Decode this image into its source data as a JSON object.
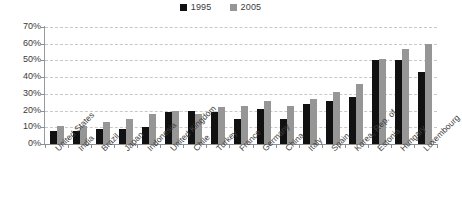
{
  "legend": {
    "position": "top-center",
    "items": [
      {
        "label": "1995",
        "color": "#111111",
        "icon": "square-marker-icon"
      },
      {
        "label": "2005",
        "color": "#969696",
        "icon": "square-marker-icon"
      }
    ]
  },
  "axes": {
    "y_ticks": [
      "70%",
      "60%",
      "50%",
      "40%",
      "30%",
      "20%",
      "10%",
      "0%"
    ],
    "grid": true
  },
  "chart_data": {
    "type": "bar",
    "title": "",
    "subtitle": "",
    "xlabel": "",
    "ylabel": "",
    "ylim": [
      0,
      70
    ],
    "ytick_values": [
      0,
      10,
      20,
      30,
      40,
      50,
      60,
      70
    ],
    "ytick_labels": [
      "0%",
      "10%",
      "20%",
      "30%",
      "40%",
      "50%",
      "60%",
      "70%"
    ],
    "y_unit": "%",
    "grid": true,
    "legend_position": "top-center",
    "categories": [
      "United States",
      "India",
      "Brazil",
      "Japan",
      "Indonesia",
      "United Kingdom",
      "Chile",
      "Turkey",
      "France",
      "Germany",
      "China",
      "Italy",
      "Spain",
      "Korea, Rep. of",
      "Estonia",
      "Hungary",
      "Luxembourg"
    ],
    "series": [
      {
        "name": "1995",
        "color": "#111111",
        "values": [
          8,
          8,
          9,
          9,
          10,
          19,
          20,
          19,
          15,
          21,
          15,
          24,
          26,
          28,
          50,
          50,
          43
        ]
      },
      {
        "name": "2005",
        "color": "#969696",
        "values": [
          11,
          11,
          13,
          15,
          18,
          20,
          18,
          22,
          23,
          26,
          23,
          27,
          31,
          36,
          51,
          57,
          60
        ]
      }
    ]
  }
}
